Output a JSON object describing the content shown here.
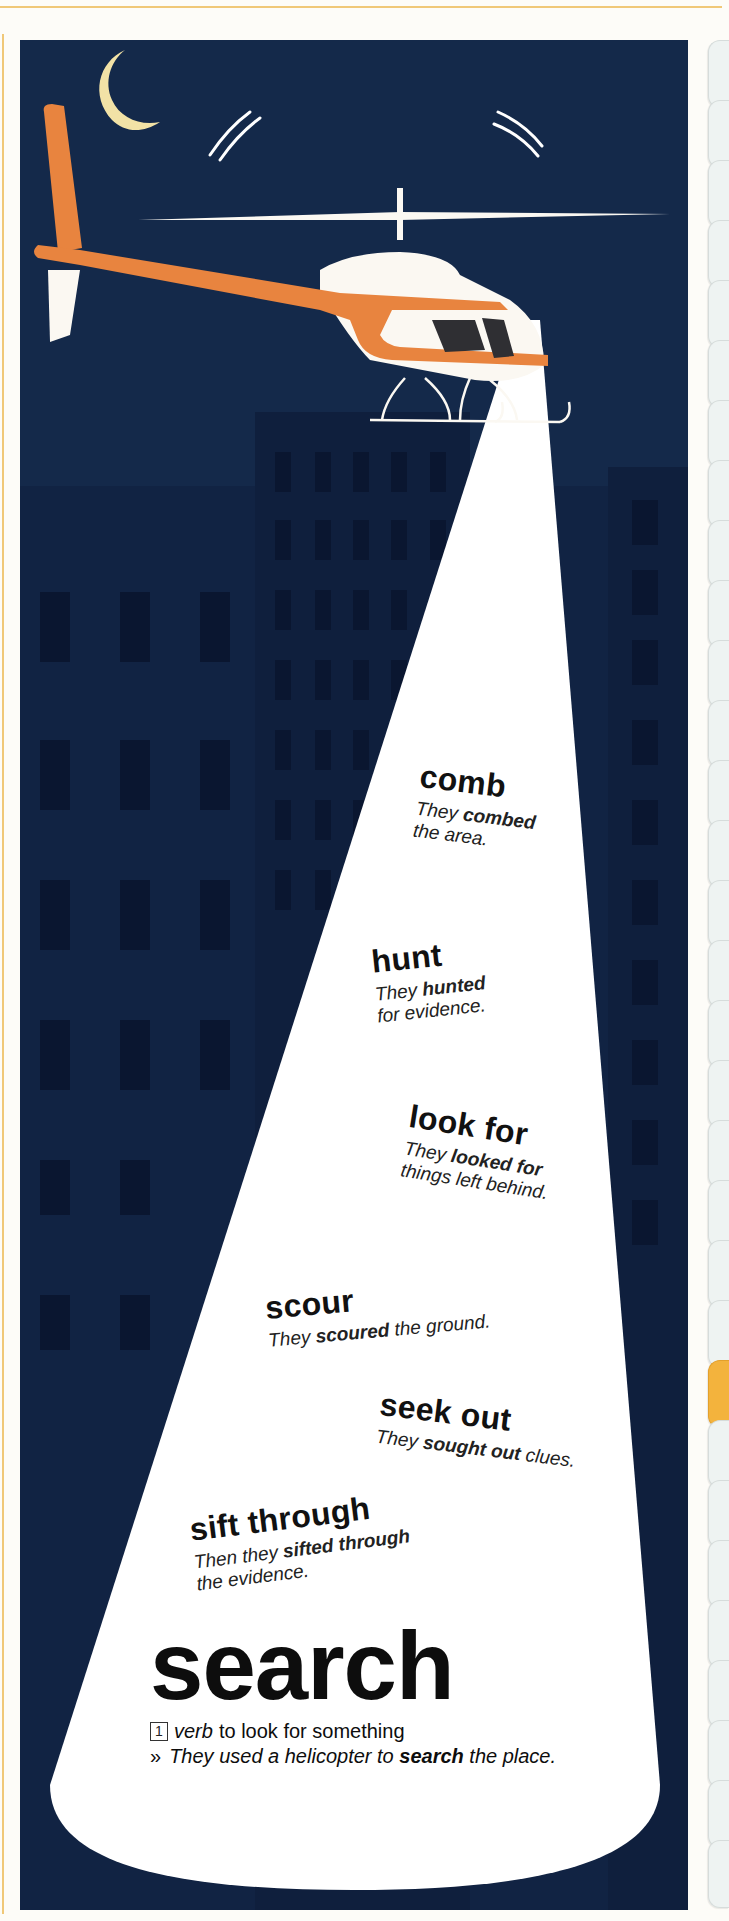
{
  "page": {
    "colors": {
      "sky": "#14294a",
      "building_dark": "#0f1f3d",
      "window": "#0a1630",
      "beam": "#ffffff",
      "helicopter_orange": "#e8843f",
      "helicopter_white": "#fbf8f2",
      "moon": "#f2e2a6",
      "rule": "#f0c878",
      "tab": "#eef3f2",
      "tab_active": "#f3b33d"
    },
    "icons": [
      "moon-icon",
      "helicopter-icon",
      "searchlight-beam",
      "city-buildings"
    ]
  },
  "synonyms": [
    {
      "word": "comb",
      "example_pre": "They ",
      "example_bold": "combed",
      "example_post": " the area."
    },
    {
      "word": "hunt",
      "example_pre": "They ",
      "example_bold": "hunted",
      "example_post": " for evidence."
    },
    {
      "word": "look for",
      "example_pre": "They ",
      "example_bold": "looked for",
      "example_post": " things left behind."
    },
    {
      "word": "scour",
      "example_pre": "They ",
      "example_bold": "scoured",
      "example_post": " the ground."
    },
    {
      "word": "seek out",
      "example_pre": "They ",
      "example_bold": "sought out",
      "example_post": " clues."
    },
    {
      "word": "sift through",
      "example_pre": "Then they ",
      "example_bold": "sifted through",
      "example_post": " the evidence."
    }
  ],
  "entry": {
    "headword": "search",
    "sense_number": "1",
    "part_of_speech": "verb",
    "definition": "to look for something",
    "example_marker": "»",
    "example_pre": "They used a helicopter to ",
    "example_bold": "search",
    "example_post": " the place."
  },
  "tabs": {
    "count": 31,
    "active_index": 22
  }
}
